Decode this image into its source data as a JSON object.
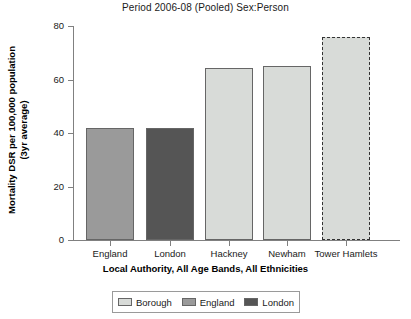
{
  "chart_data": {
    "type": "bar",
    "title": "Period 2006-08 (Pooled) Sex:Person",
    "xlabel": "Local Authority, All Age Bands, All Ethnicities",
    "ylabel_line1": "Mortality DSR per 100,000 population",
    "ylabel_line2": "(3yr average)",
    "categories": [
      "England",
      "London",
      "Hackney",
      "Newham",
      "Tower Hamlets"
    ],
    "values": [
      41.9,
      41.9,
      64.3,
      65.0,
      75.9
    ],
    "series": [
      {
        "name": "Mortality DSR",
        "values": [
          41.9,
          41.9,
          64.3,
          65.0,
          75.9
        ]
      }
    ],
    "bar_groups": [
      "England",
      "London",
      "Borough",
      "Borough",
      "Borough"
    ],
    "highlighted_category": "Tower Hamlets",
    "ylim": [
      0,
      80
    ],
    "yticks": [
      0,
      20,
      40,
      60,
      80
    ],
    "ytick_labels": [
      "0",
      "20",
      "40",
      "60",
      "80"
    ],
    "grid": false,
    "legend_position": "bottom-center"
  },
  "legend": {
    "items": [
      {
        "label": "Borough",
        "color": "#d8dbd8"
      },
      {
        "label": "England",
        "color": "#9a9a9a"
      },
      {
        "label": "London",
        "color": "#555555"
      }
    ]
  },
  "colors": {
    "borough": "#d8dbd8",
    "england": "#9a9a9a",
    "london": "#555555",
    "axis": "#808080",
    "text": "#1a1a1a",
    "highlight_border": "#333333"
  }
}
